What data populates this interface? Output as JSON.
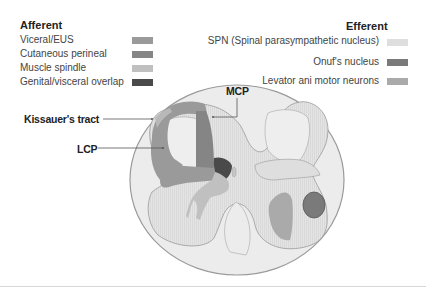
{
  "afferent": {
    "title": "Afferent",
    "items": [
      {
        "label": "Viceral/EUS",
        "color": "#9a9a9a"
      },
      {
        "label": "Cutaneous perineal",
        "color": "#858585"
      },
      {
        "label": "Muscle spindle",
        "color": "#c0c0c0"
      },
      {
        "label": "Genital/visceral overlap",
        "color": "#4a4a4a"
      }
    ]
  },
  "efferent": {
    "title": "Efferent",
    "items": [
      {
        "label": "SPN (Spinal parasympathetic nucleus)",
        "color": "#dedede"
      },
      {
        "label": "Onuf's nucleus",
        "color": "#7a7a7a"
      },
      {
        "label": "Levator ani motor neurons",
        "color": "#aaaaaa"
      }
    ]
  },
  "callouts": {
    "mcp": "MCP",
    "kissauer": "Kissauer's tract",
    "lcp": "LCP"
  },
  "colors": {
    "white_matter": "#ececec",
    "gray_matter": "#e2e2e2",
    "outline": "#8a8a8a"
  }
}
